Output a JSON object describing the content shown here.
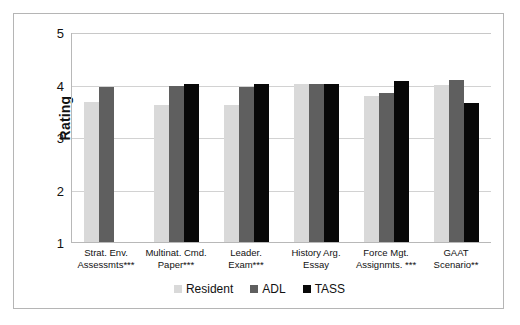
{
  "chart_data": {
    "type": "bar",
    "title": "",
    "xlabel": "",
    "ylabel": "Rating",
    "ylim": [
      1,
      5
    ],
    "yticks": [
      1,
      2,
      3,
      4,
      5
    ],
    "grid": true,
    "legend_position": "bottom",
    "categories": [
      "Strat. Env. Assessmts***",
      "Multinat. Cmd. Paper***",
      "Leader. Exam***",
      "History Arg. Essay",
      "Force Mgt. Assignmts. ***",
      "GAAT Scenario**"
    ],
    "series": [
      {
        "name": "Resident",
        "color": "#d9d9d9",
        "values": [
          3.68,
          3.63,
          3.63,
          4.02,
          3.8,
          4.0
        ]
      },
      {
        "name": "ADL",
        "color": "#5f5f5f",
        "values": [
          3.97,
          3.98,
          3.97,
          4.03,
          3.85,
          4.1
        ]
      },
      {
        "name": "TASS",
        "color": "#080808",
        "values": [
          null,
          4.02,
          4.02,
          4.03,
          4.08,
          3.67
        ]
      }
    ]
  },
  "axis": {
    "y_title": "Rating",
    "y_ticks": [
      "5",
      "4",
      "3",
      "2",
      "1"
    ]
  },
  "legend": {
    "items": [
      {
        "label": "Resident",
        "swatch": "resident"
      },
      {
        "label": "ADL",
        "swatch": "adl"
      },
      {
        "label": "TASS",
        "swatch": "tass"
      }
    ]
  }
}
